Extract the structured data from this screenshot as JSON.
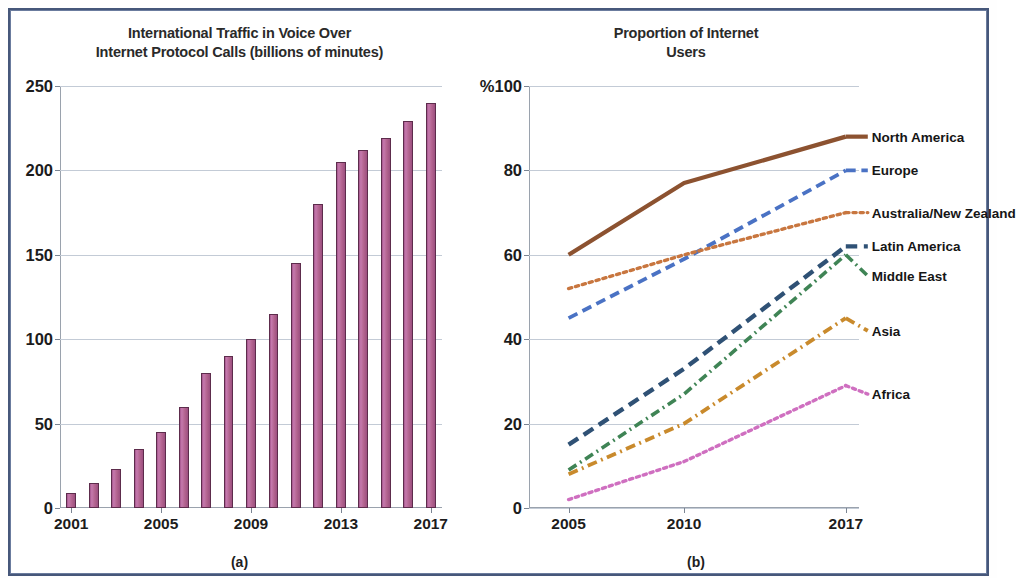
{
  "figure": {
    "border_color": "#46577a",
    "background": "#ffffff"
  },
  "panel_a": {
    "caption": "(a)",
    "title_line1": "International Traffic in Voice Over",
    "title_line2": "Internet Protocol Calls (billions of minutes)"
  },
  "panel_b": {
    "caption": "(b)",
    "title_line1": "Proportion of Internet",
    "title_line2": "Users"
  },
  "chart_data": [
    {
      "type": "bar",
      "title": "International Traffic in Voice Over Internet Protocol Calls (billions of minutes)",
      "xlabel": "",
      "ylabel": "billions of minutes",
      "ylim": [
        0,
        250
      ],
      "yticks": [
        0,
        50,
        100,
        150,
        200,
        250
      ],
      "ytick_labels": [
        "0",
        "50",
        "100",
        "150",
        "200",
        "250"
      ],
      "xticks": [
        2001,
        2005,
        2009,
        2013,
        2017
      ],
      "xtick_labels": [
        "2001",
        "2005",
        "2009",
        "2013",
        "2017"
      ],
      "grid": true,
      "bar_color": "#b3648f",
      "bar_edge_color": "#5d2c4c",
      "categories": [
        "2001",
        "2002",
        "2003",
        "2004",
        "2005",
        "2006",
        "2007",
        "2008",
        "2009",
        "2010",
        "2011",
        "2012",
        "2013",
        "2014",
        "2015",
        "2016",
        "2017"
      ],
      "values": [
        9,
        15,
        23,
        35,
        45,
        60,
        80,
        90,
        100,
        115,
        145,
        180,
        205,
        212,
        219,
        229,
        240
      ]
    },
    {
      "type": "line",
      "title": "Proportion of Internet Users",
      "xlabel": "",
      "ylabel": "%",
      "ylim": [
        0,
        100
      ],
      "yticks": [
        0,
        20,
        40,
        60,
        80,
        100
      ],
      "ytick_labels": [
        "0",
        "20",
        "40",
        "60",
        "80",
        "%100"
      ],
      "x": [
        2005,
        2010,
        2017
      ],
      "xtick_labels": [
        "2005",
        "2010",
        "2017"
      ],
      "grid": true,
      "legend_position": "right-inline",
      "series": [
        {
          "name": "North America",
          "values": [
            60,
            77,
            88
          ],
          "color": "#8c5230",
          "style": "solid",
          "width": 4.2
        },
        {
          "name": "Europe",
          "values": [
            45,
            59,
            80
          ],
          "color": "#4a72c4",
          "style": "dashed",
          "width": 3.8
        },
        {
          "name": "Australia/New Zealand",
          "values": [
            52,
            60,
            70
          ],
          "color": "#c8763f",
          "style": "dotted",
          "width": 3.4
        },
        {
          "name": "Latin America",
          "values": [
            15,
            33,
            62
          ],
          "color": "#2f5175",
          "style": "dashed",
          "width": 4.4
        },
        {
          "name": "Middle East",
          "values": [
            9,
            27,
            60
          ],
          "color": "#3f8455",
          "style": "dashdot",
          "width": 3.6
        },
        {
          "name": "Asia",
          "values": [
            8,
            20,
            45
          ],
          "color": "#c98a2c",
          "style": "dashdot",
          "width": 3.8
        },
        {
          "name": "Africa",
          "values": [
            2,
            11,
            29
          ],
          "color": "#cf6fc0",
          "style": "dotted",
          "width": 3.4
        }
      ]
    }
  ]
}
